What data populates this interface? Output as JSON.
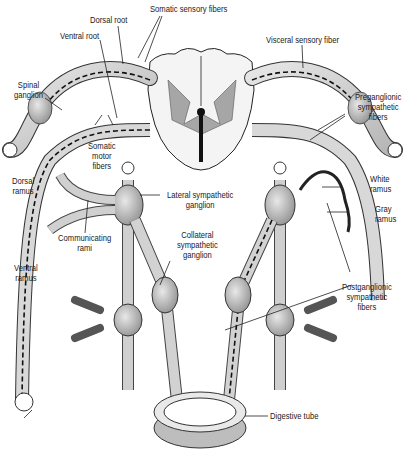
{
  "diagram": {
    "labels": {
      "somatic_sensory_fibers": "Somatic sensory fibers",
      "dorsal_root": "Dorsal root",
      "ventral_root": "Ventral root",
      "visceral_sensory_fiber": "Visceral sensory fiber",
      "spinal_ganglion": "Spinal\nganglion",
      "preganglionic_sympathetic_fibers": "Preganglionic\nsympathetic\nfibers",
      "somatic_motor_fibers": "Somatic\nmotor\nfibers",
      "dorsal_ramus": "Dorsal\nramus",
      "white_ramus": "White\nramus",
      "lateral_sympathetic_ganglion": "Lateral sympathetic\nganglion",
      "gray_ramus": "Gray\nramus",
      "communicating_rami": "Communicating\nrami",
      "collateral_sympathetic_ganglion": "Collateral\nsympathetic\nganglion",
      "ventral_ramus": "Ventral\nramus",
      "postganglionic_sympathetic_fibers": "Postganglionic\nsympathetic\nfibers",
      "digestive_tube": "Digestive tube"
    },
    "colors": {
      "ink": "#1a1a1a",
      "nerve_fill": "#d9d9d9",
      "gray_matter": "#9a9a9a",
      "background": "#ffffff"
    }
  }
}
